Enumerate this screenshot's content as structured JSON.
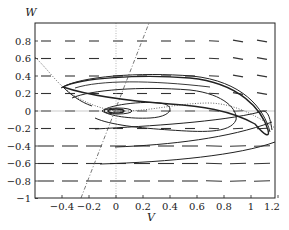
{
  "chart_data": {
    "type": "line",
    "title": "",
    "xlabel": "V",
    "ylabel": "W",
    "xlim": [
      -0.6,
      1.18
    ],
    "ylim": [
      -1.0,
      1.0
    ],
    "x_ticks": [
      "-0.4",
      "-0.2",
      "0",
      "0.2",
      "0.4",
      "0.6",
      "0.8",
      "1",
      "1.2"
    ],
    "x_tick_values": [
      -0.4,
      -0.2,
      0,
      0.2,
      0.4,
      0.6,
      0.8,
      1.0,
      1.2
    ],
    "y_ticks": [
      "0.8",
      "0.6",
      "0.4",
      "0.2",
      "0",
      "-0.2",
      "-0.4",
      "-0.6",
      "-0.8",
      "-1"
    ],
    "y_tick_values": [
      0.8,
      0.6,
      0.4,
      0.2,
      0,
      -0.2,
      -0.4,
      -0.6,
      -0.8,
      -1.0
    ],
    "grid": false,
    "legend": null,
    "series": [
      {
        "name": "V-nullcline (cubic, dotted)",
        "style": "dotted",
        "x": [
          -0.6,
          -0.5,
          -0.4,
          -0.3,
          -0.2,
          -0.1,
          0.0,
          0.2,
          0.4,
          0.6,
          0.7,
          0.8,
          1.0,
          1.1,
          1.18
        ],
        "y": [
          0.62,
          0.45,
          0.27,
          0.13,
          0.05,
          0.01,
          0.0,
          0.03,
          0.07,
          0.09,
          0.09,
          0.08,
          0.0,
          -0.1,
          -0.2
        ]
      },
      {
        "name": "W-nullcline (straight, dash-dot)",
        "style": "dashdot",
        "x": [
          -0.26,
          0.24
        ],
        "y": [
          -1.0,
          1.0
        ]
      },
      {
        "name": "Limit cycle / trajectories (solid)",
        "style": "solid",
        "description": "Trajectories spiral out from the equilibrium at (0,0) onto a relaxation limit cycle spanning V≈-0.4..1.15, W≈-0.2..0.35; additional trajectories enter from the bottom (W≈-0.2,-0.4,-0.6) and sweep right toward V≈1.15"
      }
    ],
    "equilibrium": {
      "V": 0,
      "W": 0
    },
    "reference_lines": [
      {
        "type": "vertical",
        "x": 0,
        "style": "dotted"
      },
      {
        "type": "horizontal",
        "y": 0,
        "style": "solid-thin"
      }
    ],
    "direction_field": "short horizontal dash segments on a regular grid, slightly tilted near the right side"
  }
}
